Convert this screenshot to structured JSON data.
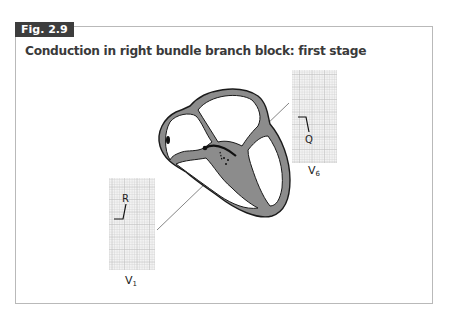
{
  "figure": {
    "label": "Fig. 2.9",
    "title": "Conduction in right bundle branch block: first stage"
  },
  "leads": [
    {
      "name": "V",
      "subscript": "1",
      "wave_label": "R"
    },
    {
      "name": "V",
      "subscript": "6",
      "wave_label": "Q"
    }
  ],
  "colors": {
    "label_bg": "#3d3d3d",
    "title_text": "#3a3a3a",
    "frame_border": "#b9b9b9",
    "myocardium": "#8c8c8c",
    "grid_line": "#c8c8c8",
    "grid_bg": "#f1f1f1"
  }
}
